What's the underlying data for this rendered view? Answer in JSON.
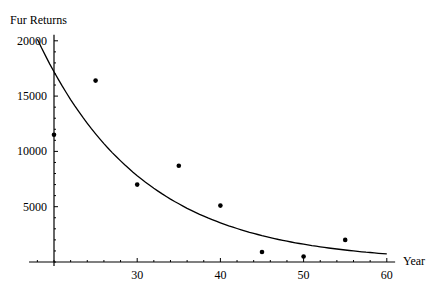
{
  "chart_data": {
    "type": "scatter",
    "title": "",
    "xlabel": "Year",
    "ylabel": "Fur Returns",
    "xlim": [
      17,
      61
    ],
    "ylim": [
      0,
      20000
    ],
    "x_origin": 20,
    "x_ticks": [
      30,
      40,
      50,
      60
    ],
    "y_ticks": [
      5000,
      10000,
      15000,
      20000
    ],
    "x_minor_step": 2,
    "y_minor_step": 1000,
    "grid": false,
    "legend": null,
    "series": [
      {
        "name": "Data",
        "type": "scatter",
        "x": [
          20,
          25,
          30,
          35,
          40,
          45,
          50,
          55
        ],
        "y": [
          11500,
          16400,
          7000,
          8700,
          5100,
          900,
          500,
          2000
        ]
      },
      {
        "name": "Exponential fit",
        "type": "line",
        "model": "y = 17200 * exp(-0.079 * (x - 20))",
        "x": [
          18,
          20,
          25,
          30,
          35,
          40,
          45,
          50,
          55,
          60
        ],
        "y": [
          20200,
          17200,
          11570,
          7790,
          5240,
          3530,
          2370,
          1600,
          1070,
          720
        ]
      }
    ]
  }
}
